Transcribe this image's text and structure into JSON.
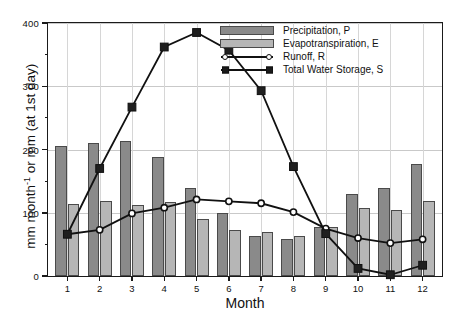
{
  "chart_data": {
    "type": "bar",
    "title": "",
    "xlabel": "Month",
    "ylabel": "mm month⁻¹ or mm (at 1st day)",
    "categories": [
      "1",
      "2",
      "3",
      "4",
      "5",
      "6",
      "7",
      "8",
      "9",
      "10",
      "11",
      "12"
    ],
    "xlim": [
      0.4,
      12.6
    ],
    "ylim": [
      0,
      400
    ],
    "yticks": [
      0,
      100,
      200,
      300,
      400
    ],
    "ytick_labels": [
      "0",
      "100",
      "200",
      "300",
      "400"
    ],
    "yminor_ticks": [
      50,
      150,
      250,
      350
    ],
    "grid": "horizontal-and-vertical",
    "legend_position": "top-right-inside",
    "series": [
      {
        "name": "Precipitation, P",
        "kind": "bar",
        "color": "#8a8a8a",
        "edge": "#4a4a4a",
        "values": [
          205,
          211,
          214,
          188,
          139,
          100,
          64,
          59,
          77,
          130,
          139,
          177
        ]
      },
      {
        "name": "Evapotranspiration, E",
        "kind": "bar",
        "color": "#b6b6b6",
        "edge": "#4a4a4a",
        "values": [
          114,
          119,
          112,
          117,
          90,
          72,
          69,
          64,
          78,
          107,
          105,
          119
        ]
      },
      {
        "name": "Runoff, R",
        "kind": "line",
        "color": "#111111",
        "marker": "open-circle",
        "values": [
          66,
          73,
          99,
          108,
          121,
          118,
          115,
          101,
          75,
          60,
          52,
          58
        ]
      },
      {
        "name": "Total Water Storage, S",
        "kind": "line",
        "color": "#111111",
        "marker": "filled-square",
        "values": [
          66,
          170,
          267,
          362,
          385,
          357,
          293,
          173,
          67,
          12,
          2,
          17
        ]
      }
    ]
  },
  "legend": {
    "items": [
      {
        "label": "Precipitation, P",
        "type": "swatch",
        "color": "#8a8a8a"
      },
      {
        "label": "Evapotranspiration, E",
        "type": "swatch",
        "color": "#b6b6b6"
      },
      {
        "label": "Runoff, R",
        "type": "line-circle",
        "color": "#111111"
      },
      {
        "label": "Total Water Storage, S",
        "type": "line-square",
        "color": "#111111"
      }
    ]
  }
}
